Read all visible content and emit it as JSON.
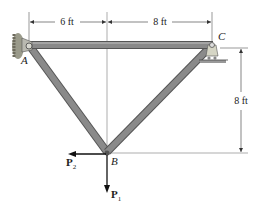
{
  "diagram": {
    "type": "truss",
    "points": {
      "A": "A",
      "B": "B",
      "C": "C"
    },
    "dimensions": {
      "horizontal_left": "6 ft",
      "horizontal_right": "8 ft",
      "vertical": "8 ft"
    },
    "forces": {
      "P1": {
        "symbol": "P",
        "subscript": "1",
        "direction": "down"
      },
      "P2": {
        "symbol": "P",
        "subscript": "2",
        "direction": "left"
      }
    },
    "members": [
      "AC",
      "AB",
      "BC"
    ],
    "supports": {
      "A": "pin",
      "C": "roller"
    },
    "colors": {
      "member_fill": "#8a8a8a",
      "member_edge": "#555555",
      "line": "#333333"
    }
  }
}
